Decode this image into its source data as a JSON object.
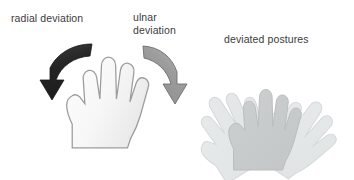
{
  "figure": {
    "title_visible": false,
    "background_color": "#ffffff",
    "width": 354,
    "height": 180
  },
  "labels": {
    "radial": "radial deviation",
    "ulnar_line1": "ulnar",
    "ulnar_line2": "deviation",
    "postures": "deviated postures"
  },
  "colors": {
    "text": "#3b3b3b",
    "radial_arrow_fill": "#262626",
    "radial_arrow_fill_light": "#3d3d3d",
    "ulnar_arrow_fill": "#9a9a9a",
    "ulnar_arrow_fill_light": "#b5b5b5",
    "ulnar_arrow_stroke": "#6f6f6f",
    "hand_fill": "#fafafa",
    "hand_fill_shade": "#ededed",
    "hand_stroke": "#9b9b9b",
    "ghost_hand_fill": "#e3e6e6",
    "ghost_hand_stroke": "#d2d6d6",
    "center_hand_fill": "#c9cccc",
    "center_hand_stroke": "#b8bcbc",
    "background": "#ffffff"
  },
  "elements": {
    "main_hand": "left-open-palm-hand",
    "radial_arrow": "curved-arrow-pointing-down-left",
    "ulnar_arrow": "curved-arrow-pointing-down-right",
    "posture_cluster": {
      "hand_left_rotated": "ghost-hand-rotated-counterclockwise",
      "hand_center": "neutral-hand-shaded",
      "hand_right_rotated": "ghost-hand-rotated-clockwise"
    }
  }
}
